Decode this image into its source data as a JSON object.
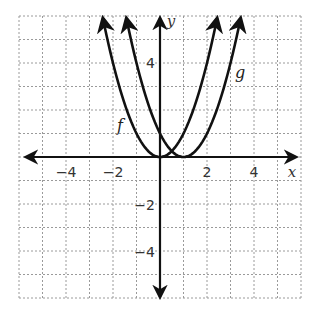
{
  "chart_data": {
    "type": "line",
    "title": "",
    "xlabel": "x",
    "ylabel": "y",
    "xlim": [
      -6,
      6
    ],
    "ylim": [
      -6,
      6
    ],
    "grid": true,
    "grid_style": "dashed",
    "x_ticks": [
      -4,
      -2,
      2,
      4
    ],
    "y_ticks": [
      4,
      -2,
      -4
    ],
    "x_tick_labels": [
      "−4",
      "−2",
      "2",
      "4"
    ],
    "y_tick_labels": [
      "4",
      "−2",
      "−4"
    ],
    "series": [
      {
        "name": "f",
        "equation": "f(x) = x^2",
        "vertex": [
          0,
          0
        ],
        "x": [
          -2.4,
          -2,
          -1,
          0,
          1,
          2,
          2.4
        ],
        "y": [
          5.76,
          4,
          1,
          0,
          1,
          4,
          5.76
        ],
        "label_position": [
          -1.7,
          1.4
        ]
      },
      {
        "name": "g",
        "equation": "g(x) = (x - 1)^2",
        "vertex": [
          1,
          0
        ],
        "x": [
          -1.4,
          -1,
          0,
          1,
          2,
          3,
          3.4
        ],
        "y": [
          5.76,
          4,
          1,
          0,
          1,
          4,
          5.76
        ],
        "label_position": [
          3.3,
          3.6
        ]
      }
    ],
    "annotations": [
      "f",
      "g"
    ],
    "legend": "none"
  },
  "labels": {
    "x_axis": "x",
    "y_axis": "y",
    "f": "f",
    "g": "g",
    "xt_m4": "−4",
    "xt_m2": "−2",
    "xt_2": "2",
    "xt_4": "4",
    "yt_4": "4",
    "yt_m2": "−2",
    "yt_m4": "−4"
  },
  "colors": {
    "curve": "#111111",
    "axis": "#111111",
    "grid": "#9a9a9a",
    "text": "#333333"
  }
}
